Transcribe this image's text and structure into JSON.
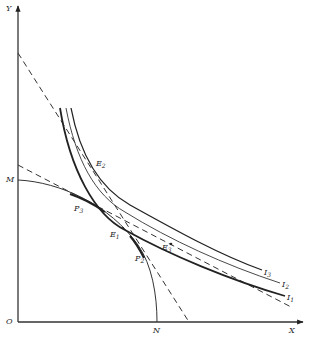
{
  "diagram": {
    "type": "economics-indifference-production-possibility",
    "axes": {
      "y_label": "Y",
      "x_label": "X",
      "origin_label": "O"
    },
    "points": {
      "M": {
        "label": "M"
      },
      "N": {
        "label": "N"
      },
      "P3": {
        "label": "P",
        "sub": "3"
      },
      "P2": {
        "label": "P",
        "sub": "2"
      },
      "E1": {
        "label": "E",
        "sub": "1"
      },
      "E2": {
        "label": "E",
        "sub": "2"
      },
      "E3": {
        "label": "E",
        "sub": "3"
      }
    },
    "curves": {
      "I1": {
        "label": "I",
        "sub": "1",
        "style": "bold"
      },
      "I2": {
        "label": "I",
        "sub": "2",
        "style": "thin"
      },
      "I3": {
        "label": "I",
        "sub": "3",
        "style": "medium"
      },
      "transformation_curve": {
        "from": "M",
        "to": "N"
      },
      "price_line_steep": {
        "style": "dashed"
      },
      "price_line_shallow": {
        "style": "dashed"
      }
    },
    "colors": {
      "ink": "#222222",
      "background": "#ffffff"
    }
  }
}
